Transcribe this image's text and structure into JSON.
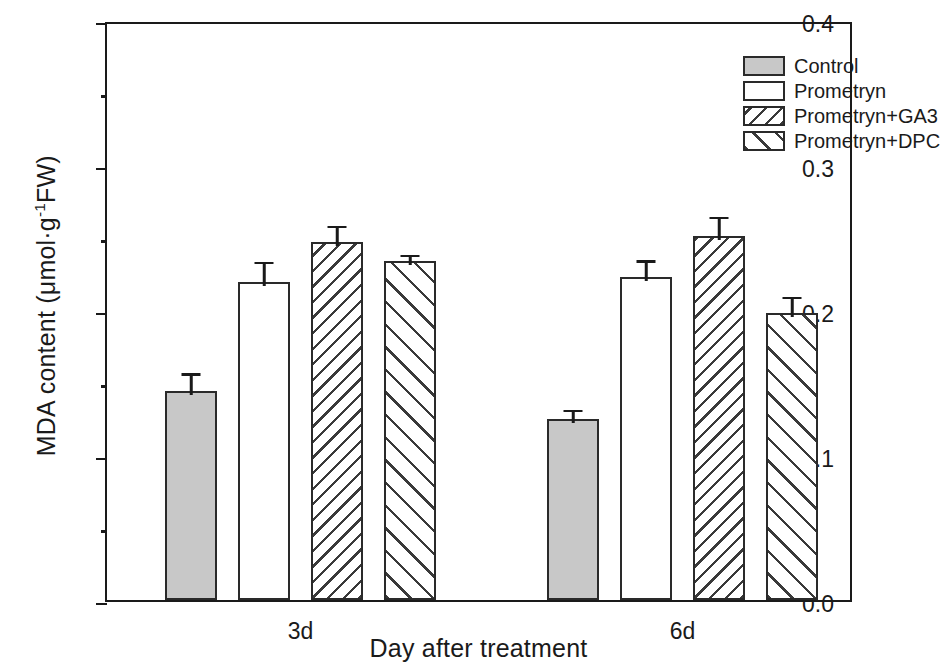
{
  "chart_data": {
    "type": "bar",
    "title": "",
    "xlabel": "Day after treatment",
    "ylabel": "MDA content (μmol·g⁻¹FW)",
    "ylabel_parts": {
      "prefix": "MDA content (μmol·g",
      "superscript": "-1",
      "suffix": "FW)"
    },
    "categories": [
      "3d",
      "6d"
    ],
    "ylim": [
      0.0,
      0.4
    ],
    "ytick_labels": [
      "0.0",
      "0.1",
      "0.2",
      "0.3",
      "0.4"
    ],
    "ytick_values": [
      0.0,
      0.1,
      0.2,
      0.3,
      0.4
    ],
    "yminor_values": [
      0.05,
      0.15,
      0.25,
      0.35
    ],
    "grid": false,
    "legend_position": "top-right",
    "series": [
      {
        "name": "Control",
        "fill": "solid-grey",
        "values": [
          0.144,
          0.125
        ],
        "errors": [
          0.015,
          0.009
        ]
      },
      {
        "name": "Prometryn",
        "fill": "white",
        "values": [
          0.219,
          0.223
        ],
        "errors": [
          0.017,
          0.014
        ]
      },
      {
        "name": "Prometryn+GA3",
        "fill": "hatch-back",
        "values": [
          0.247,
          0.251
        ],
        "errors": [
          0.014,
          0.016
        ]
      },
      {
        "name": "Prometryn+DPC",
        "fill": "hatch-fwd",
        "values": [
          0.234,
          0.198
        ],
        "errors": [
          0.007,
          0.014
        ]
      }
    ]
  },
  "legend": {
    "items": [
      {
        "label": "Control",
        "fill": "solid-grey"
      },
      {
        "label": "Prometryn",
        "fill": "white"
      },
      {
        "label": "Prometryn+GA3",
        "fill": "hatch-back"
      },
      {
        "label": "Prometryn+DPC",
        "fill": "hatch-fwd"
      }
    ]
  },
  "colors": {
    "axis": "#1a1a1a",
    "bar_outline": "#2a2a2a",
    "control_fill": "#c8c8c8",
    "hatch_line": "#3a3a3a",
    "background": "#ffffff"
  }
}
